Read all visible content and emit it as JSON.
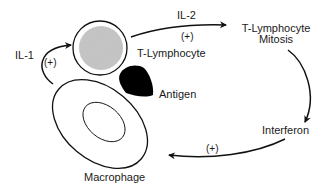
{
  "diagram": {
    "nodes": {
      "t_lymphocyte": "T-Lymphocyte",
      "antigen": "Antigen",
      "macrophage": "Macrophage",
      "mitosis_line1": "T-Lymphocyte",
      "mitosis_line2": "Mitosis",
      "interferon": "Interferon"
    },
    "edges": {
      "il1": {
        "label": "IL-1",
        "sign": "(+)"
      },
      "il2": {
        "label": "IL-2",
        "sign": "(+)"
      },
      "interferon_to_macrophage": {
        "sign": "(+)"
      }
    },
    "colors": {
      "stroke": "#111111",
      "tcell_fill": "#bdbdbd",
      "antigen_fill": "#000000"
    }
  }
}
